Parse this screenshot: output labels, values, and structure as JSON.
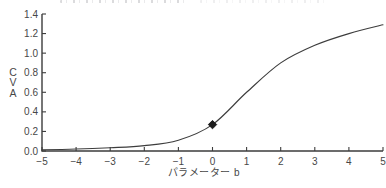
{
  "figure": {
    "background": "#ffffff",
    "ink_color": "#3d3d3d",
    "text_color": "#474747",
    "y_axis_letters": [
      "C",
      "V",
      "A"
    ]
  },
  "chart_data": {
    "type": "line",
    "title": "",
    "xlabel": "パラメーター b",
    "ylabel": "CVA",
    "x": [
      -5,
      -4,
      -3,
      -2,
      -1,
      0,
      1,
      2,
      3,
      4,
      5
    ],
    "series": [
      {
        "name": "CVA",
        "values": [
          0.012,
          0.02,
          0.033,
          0.055,
          0.11,
          0.27,
          0.6,
          0.9,
          1.08,
          1.2,
          1.29
        ]
      }
    ],
    "xlim": [
      -5,
      5
    ],
    "ylim": [
      0,
      1.4
    ],
    "x_ticks": [
      -5,
      -4,
      -3,
      -2,
      -1,
      0,
      1,
      2,
      3,
      4,
      5
    ],
    "x_tick_labels": [
      "−5",
      "−4",
      "−3",
      "−2",
      "−1",
      "0",
      "1",
      "2",
      "3",
      "4",
      "5"
    ],
    "y_ticks": [
      0.0,
      0.2,
      0.4,
      0.6,
      0.8,
      1.0,
      1.2,
      1.4
    ],
    "y_tick_labels": [
      "0.0",
      "0.2",
      "0.4",
      "0.6",
      "0.8",
      "1.0",
      "1.2",
      "1.4"
    ],
    "grid": false,
    "legend": "none",
    "line_color": "#3d3d3d",
    "annotations": [
      {
        "type": "marker",
        "shape": "filled-diamond",
        "x": 0,
        "y": 0.27,
        "color": "#1c1c1c"
      }
    ]
  }
}
